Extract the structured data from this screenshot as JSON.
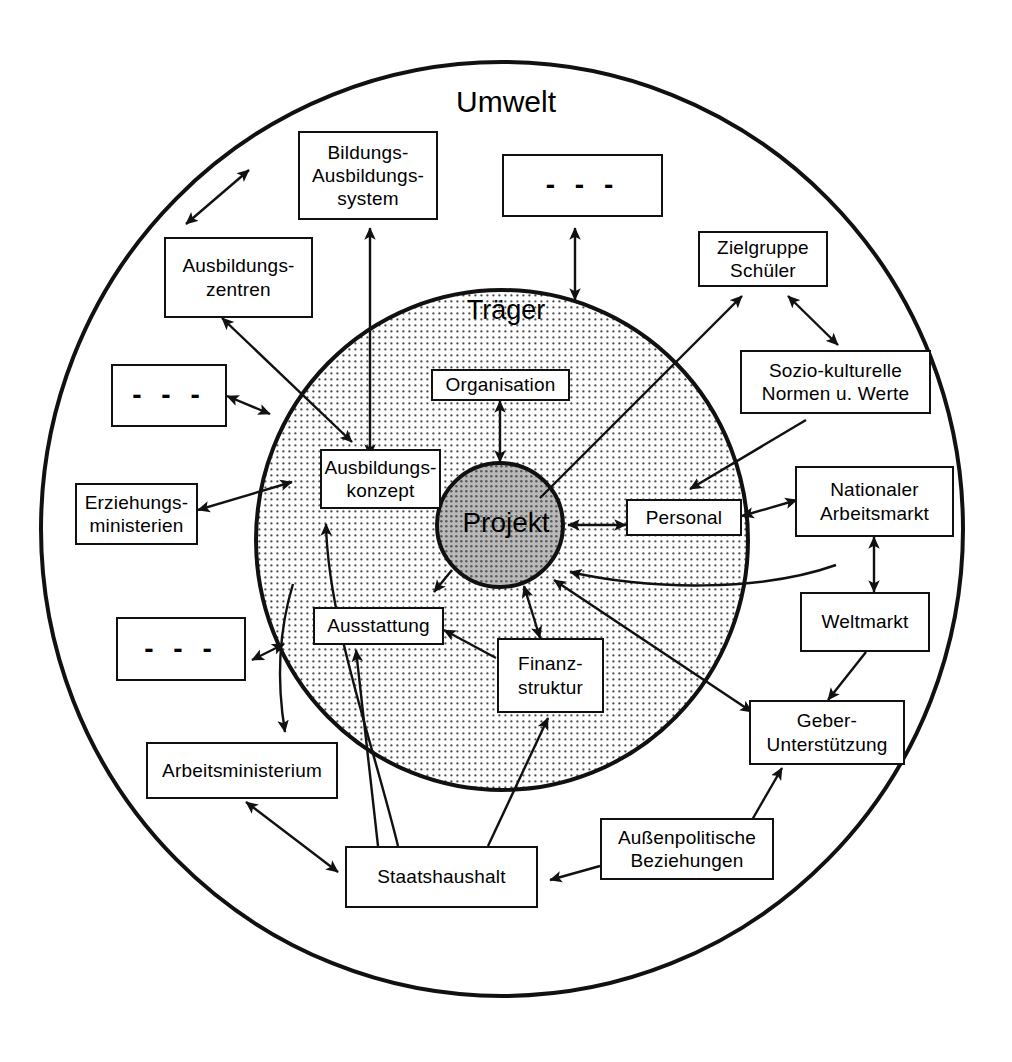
{
  "diagram": {
    "rings": [
      {
        "id": "umwelt",
        "label": "Umwelt",
        "fill": "#ffffff",
        "stroke": "#111111"
      },
      {
        "id": "traeger",
        "label": "Träger",
        "fill": "#e8e8e8",
        "stroke": "#111111"
      },
      {
        "id": "projekt",
        "label": "Projekt",
        "fill": "#a8a8a8",
        "stroke": "#111111"
      }
    ],
    "nodes": [
      {
        "id": "bildungssystem",
        "label": "Bildungs-\nAusbildungs-\nsystem",
        "zone": "umwelt"
      },
      {
        "id": "dots-top",
        "label": "- - -",
        "zone": "umwelt"
      },
      {
        "id": "ausbildungszentren",
        "label": "Ausbildungs-\nzentren",
        "zone": "umwelt"
      },
      {
        "id": "zielgruppe",
        "label": "Zielgruppe\nSchüler",
        "zone": "umwelt"
      },
      {
        "id": "dots-left",
        "label": "- - -",
        "zone": "umwelt"
      },
      {
        "id": "sozio",
        "label": "Sozio-kulturelle\nNormen u. Werte",
        "zone": "umwelt"
      },
      {
        "id": "erziehungsministerien",
        "label": "Erziehungs-\nministerien",
        "zone": "umwelt"
      },
      {
        "id": "arbeitsmarkt",
        "label": "Nationaler\nArbeitsmarkt",
        "zone": "umwelt"
      },
      {
        "id": "weltmarkt",
        "label": "Weltmarkt",
        "zone": "umwelt"
      },
      {
        "id": "dots-bottomleft",
        "label": "- - -",
        "zone": "umwelt"
      },
      {
        "id": "geber",
        "label": "Geber-\nUnterstützung",
        "zone": "umwelt"
      },
      {
        "id": "arbeitsministerium",
        "label": "Arbeitsministerium",
        "zone": "umwelt"
      },
      {
        "id": "staatshaushalt",
        "label": "Staatshaushalt",
        "zone": "umwelt"
      },
      {
        "id": "aussenpolitik",
        "label": "Außenpolitische\nBeziehungen",
        "zone": "umwelt"
      },
      {
        "id": "organisation",
        "label": "Organisation",
        "zone": "traeger"
      },
      {
        "id": "ausbildungskonzept",
        "label": "Ausbildungs-\nkonzept",
        "zone": "traeger"
      },
      {
        "id": "personal",
        "label": "Personal",
        "zone": "traeger"
      },
      {
        "id": "ausstattung",
        "label": "Ausstattung",
        "zone": "traeger"
      },
      {
        "id": "finanzstruktur",
        "label": "Finanz-\nstruktur",
        "zone": "traeger"
      }
    ],
    "edges": [
      {
        "from": "ausbildungszentren",
        "to": "bildungssystem",
        "type": "double"
      },
      {
        "from": "ausbildungskonzept",
        "to": "bildungssystem",
        "type": "double"
      },
      {
        "from": "dots-top",
        "to": "traeger",
        "type": "double"
      },
      {
        "from": "ausbildungszentren",
        "to": "ausbildungskonzept",
        "type": "double"
      },
      {
        "from": "dots-left",
        "to": "traeger",
        "type": "double"
      },
      {
        "from": "erziehungsministerien",
        "to": "ausbildungskonzept",
        "type": "double"
      },
      {
        "from": "projekt",
        "to": "zielgruppe",
        "type": "single"
      },
      {
        "from": "sozio",
        "to": "zielgruppe",
        "type": "double"
      },
      {
        "from": "sozio",
        "to": "personal",
        "type": "single"
      },
      {
        "from": "projekt",
        "to": "personal",
        "type": "double"
      },
      {
        "from": "personal",
        "to": "arbeitsmarkt",
        "type": "double"
      },
      {
        "from": "arbeitsmarkt",
        "to": "projekt",
        "type": "single"
      },
      {
        "from": "arbeitsmarkt",
        "to": "weltmarkt",
        "type": "double"
      },
      {
        "from": "weltmarkt",
        "to": "geber",
        "type": "single"
      },
      {
        "from": "projekt",
        "to": "organisation",
        "type": "double"
      },
      {
        "from": "projekt",
        "to": "ausbildungskonzept",
        "type": "single"
      },
      {
        "from": "projekt",
        "to": "ausstattung",
        "type": "single"
      },
      {
        "from": "projekt",
        "to": "finanzstruktur",
        "type": "double"
      },
      {
        "from": "finanzstruktur",
        "to": "ausstattung",
        "type": "single"
      },
      {
        "from": "geber",
        "to": "projekt",
        "type": "single"
      },
      {
        "from": "dots-bottomleft",
        "to": "umwelt",
        "type": "double"
      },
      {
        "from": "traeger",
        "to": "arbeitsministerium",
        "type": "single"
      },
      {
        "from": "arbeitsministerium",
        "to": "staatshaushalt",
        "type": "double"
      },
      {
        "from": "staatshaushalt",
        "to": "ausstattung",
        "type": "single"
      },
      {
        "from": "staatshaushalt",
        "to": "ausbildungskonzept",
        "type": "single"
      },
      {
        "from": "staatshaushalt",
        "to": "finanzstruktur",
        "type": "single"
      },
      {
        "from": "aussenpolitik",
        "to": "staatshaushalt",
        "type": "single"
      },
      {
        "from": "aussenpolitik",
        "to": "geber",
        "type": "single"
      }
    ]
  }
}
